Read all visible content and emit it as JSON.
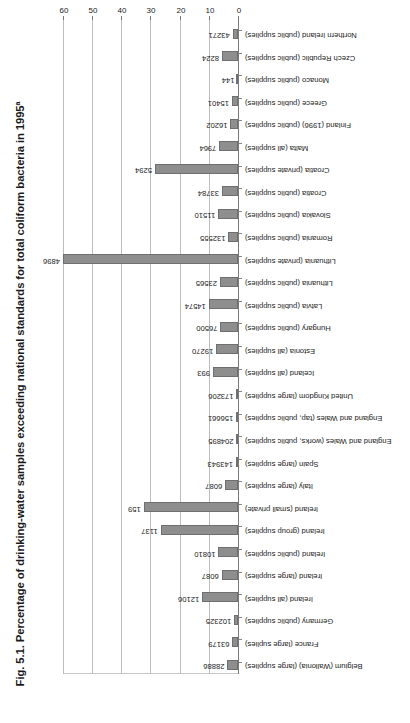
{
  "figure": {
    "title": "Fig. 5.1. Percentage of drinking-water samples exceeding national standards for total coliform bacteria in 1995",
    "title_superscript": "a"
  },
  "chart_data": {
    "type": "bar",
    "orientation": "horizontal",
    "title": "Fig. 5.1. Percentage of drinking-water samples exceeding national standards for total coliform bacteria in 1995a",
    "xlabel": "Percentage",
    "ylabel": "",
    "xlim": [
      0,
      60
    ],
    "xticks": [
      0,
      10,
      20,
      30,
      40,
      50,
      60
    ],
    "xtick_labels": [
      "0",
      "10",
      "20",
      "30",
      "40",
      "50",
      "60"
    ],
    "grid": true,
    "legend": null,
    "value_label_note": "Numbers at the end of each bar are the number of samples (n)",
    "categories": [
      "Belgium (Wallonia) (large supplies)",
      "France (large suplies)",
      "Germany (public supplies)",
      "Ireland (all supplies)",
      "Ireland (large supplies)",
      "Ireland (public supplies)",
      "Ireland (group supplies)",
      "Ireland (small private)",
      "Italy (large supplies)",
      "Spain (large supplies)",
      "England and Wales (works, public supplies)",
      "England and Wales (tap, public supplies)",
      "United Kingdom (large supplies)",
      "Iceland (all supplies)",
      "Estonia (all supplies)",
      "Hungary (public supplies)",
      "Latvia (public supplies)",
      "Lithuania (public supplies)",
      "Lithuania (private supplies)",
      "Romania (public supplies)",
      "Slovakia (public supplies)",
      "Croatia (public supplies)",
      "Croatia (private supplies)",
      "Malta (all supplies)",
      "Finland (1996) (public supplies)",
      "Greece (public supplies)",
      "Monaco (public supplies)",
      "Czech Republic (public supplies)",
      "Northern Ireland (public supplies)"
    ],
    "values": [
      3.6,
      1.9,
      1.3,
      12.3,
      5.6,
      6.7,
      26.5,
      32.3,
      4.4,
      0.7,
      0.5,
      0.6,
      0.5,
      8.6,
      7.5,
      6.0,
      10.0,
      6.2,
      60.0,
      3.3,
      6.8,
      5.5,
      28.5,
      6.4,
      2.6,
      2.1,
      0.0,
      5.5,
      1.8
    ],
    "sample_sizes": [
      "28886",
      "63179",
      "102325",
      "12106",
      "6087",
      "10810",
      "1137",
      "159",
      "6087",
      "143943",
      "204895",
      "156661",
      "173206",
      "993",
      "19270",
      "76500",
      "14574",
      "23565",
      "4896",
      "132555",
      "11510",
      "33784",
      "5294",
      "7964",
      "16202",
      "15401",
      "144",
      "8224",
      "43271"
    ]
  },
  "axis": {
    "x_title": "Percentage"
  }
}
